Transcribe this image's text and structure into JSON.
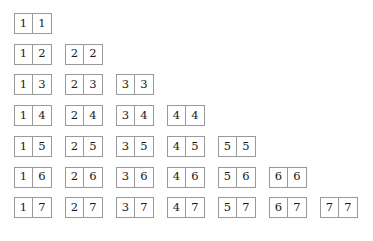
{
  "figure": {
    "kind": "domino-set-triangle",
    "max_pips": 7,
    "total_tiles": 28,
    "colors": {
      "background": "#ffffff",
      "tile_fill": "#ffffff",
      "tile_border": "#9a9a9a",
      "digit": "#1a1a1a"
    },
    "layout": {
      "tile_width": 38,
      "tile_height": 21,
      "column_pitch": 51,
      "row_pitch": 30.7,
      "origin_x": 14,
      "origin_y": 13
    }
  },
  "rows": [
    {
      "index": 1,
      "tiles": [
        {
          "left": "1",
          "right": "1"
        }
      ]
    },
    {
      "index": 2,
      "tiles": [
        {
          "left": "1",
          "right": "2"
        },
        {
          "left": "2",
          "right": "2"
        }
      ]
    },
    {
      "index": 3,
      "tiles": [
        {
          "left": "1",
          "right": "3"
        },
        {
          "left": "2",
          "right": "3"
        },
        {
          "left": "3",
          "right": "3"
        }
      ]
    },
    {
      "index": 4,
      "tiles": [
        {
          "left": "1",
          "right": "4"
        },
        {
          "left": "2",
          "right": "4"
        },
        {
          "left": "3",
          "right": "4"
        },
        {
          "left": "4",
          "right": "4"
        }
      ]
    },
    {
      "index": 5,
      "tiles": [
        {
          "left": "1",
          "right": "5"
        },
        {
          "left": "2",
          "right": "5"
        },
        {
          "left": "3",
          "right": "5"
        },
        {
          "left": "4",
          "right": "5"
        },
        {
          "left": "5",
          "right": "5"
        }
      ]
    },
    {
      "index": 6,
      "tiles": [
        {
          "left": "1",
          "right": "6"
        },
        {
          "left": "2",
          "right": "6"
        },
        {
          "left": "3",
          "right": "6"
        },
        {
          "left": "4",
          "right": "6"
        },
        {
          "left": "5",
          "right": "6"
        },
        {
          "left": "6",
          "right": "6"
        }
      ]
    },
    {
      "index": 7,
      "tiles": [
        {
          "left": "1",
          "right": "7"
        },
        {
          "left": "2",
          "right": "7"
        },
        {
          "left": "3",
          "right": "7"
        },
        {
          "left": "4",
          "right": "7"
        },
        {
          "left": "5",
          "right": "7"
        },
        {
          "left": "6",
          "right": "7"
        },
        {
          "left": "7",
          "right": "7"
        }
      ]
    }
  ]
}
